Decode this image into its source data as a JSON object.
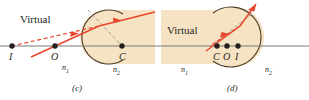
{
  "figure": {
    "background_color": "#ffffff",
    "width": 309,
    "height": 100
  },
  "colors": {
    "medium_fill": "#f6e3c3",
    "medium_stroke": "#4a3a28",
    "axis": "#7a7a7a",
    "ray": "#e8452c",
    "virtual_ray": "#e8452c",
    "normal_line": "#9a9a9a",
    "label": "#231f20"
  },
  "panels": [
    {
      "id": "c",
      "caption": "(c)",
      "virtual_label": "Virtual",
      "points": [
        {
          "name": "I",
          "label": "I"
        },
        {
          "name": "O",
          "label": "O"
        },
        {
          "name": "C",
          "label": "C"
        }
      ],
      "media": [
        {
          "name": "n1",
          "label": "n",
          "sub": "1"
        },
        {
          "name": "n2",
          "label": "n",
          "sub": "2"
        }
      ]
    },
    {
      "id": "d",
      "caption": "(d)",
      "virtual_label": "Virtual",
      "points": [
        {
          "name": "C",
          "label": "C"
        },
        {
          "name": "O",
          "label": "O"
        },
        {
          "name": "I",
          "label": "I"
        }
      ],
      "media": [
        {
          "name": "n1",
          "label": "n",
          "sub": "1"
        },
        {
          "name": "n2",
          "label": "n",
          "sub": "2"
        }
      ]
    }
  ]
}
